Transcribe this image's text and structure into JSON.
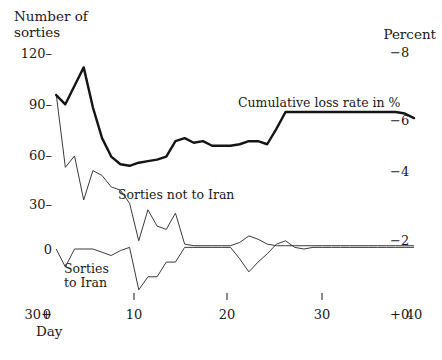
{
  "chart_data": {
    "type": "line",
    "title": "",
    "left_axis": {
      "title_line1": "Number of",
      "title_line2": "sorties",
      "label": "Number of sorties",
      "ticks": [
        "120",
        "90",
        "60",
        "30",
        "0",
        "30+"
      ],
      "tick_values": [
        120,
        90,
        60,
        30,
        0,
        -30
      ],
      "ylim": [
        -30,
        120
      ]
    },
    "right_axis": {
      "title": "Percent",
      "label": "Percent",
      "ticks": [
        "−8",
        "−6",
        "−4",
        "−2",
        "+0"
      ],
      "tick_values": [
        8,
        6,
        4,
        2,
        0
      ],
      "ylim": [
        0,
        8
      ]
    },
    "xaxis": {
      "label": "Day",
      "ticks": [
        "0",
        "10",
        "20",
        "30",
        "40"
      ],
      "tick_values": [
        0,
        10,
        20,
        30,
        40
      ],
      "xlim": [
        0,
        40
      ]
    },
    "grid": false,
    "legend_position": "inline-annotations",
    "series": [
      {
        "name": "Cumulative loss rate in %",
        "axis": "right",
        "style": "thick",
        "annotation": "Cumulative loss rate in %",
        "x": [
          1,
          2,
          3,
          4,
          5,
          6,
          7,
          8,
          9,
          10,
          11,
          12,
          13,
          14,
          15,
          16,
          17,
          18,
          19,
          20,
          21,
          22,
          23,
          24,
          25,
          26,
          27,
          28,
          29,
          30,
          31,
          32,
          33,
          34,
          35,
          36,
          37,
          38,
          39,
          40
        ],
        "y": [
          6.6,
          6.3,
          6.9,
          7.5,
          6.2,
          5.2,
          4.6,
          4.35,
          4.3,
          4.4,
          4.45,
          4.5,
          4.6,
          5.1,
          5.2,
          5.05,
          5.1,
          4.95,
          4.95,
          4.95,
          5.0,
          5.1,
          5.1,
          5.0,
          5.5,
          6.05,
          6.05,
          6.05,
          6.05,
          6.05,
          6.05,
          6.05,
          6.05,
          6.05,
          6.05,
          6.05,
          6.05,
          6.05,
          6.0,
          5.85
        ]
      },
      {
        "name": "Sorties not to Iran",
        "axis": "left",
        "style": "thin",
        "annotation": "Sorties not to Iran",
        "x": [
          1,
          2,
          3,
          4,
          5,
          6,
          7,
          8,
          9,
          10,
          11,
          12,
          13,
          14,
          15,
          16,
          17,
          18,
          19,
          20,
          21,
          22,
          23,
          24,
          25,
          26,
          27,
          28,
          29,
          30,
          31,
          32,
          33,
          34,
          35,
          36,
          37,
          38,
          39,
          40
        ],
        "y": [
          95,
          50,
          57,
          30,
          48,
          45,
          38,
          36,
          28,
          5,
          24,
          14,
          12,
          22,
          3,
          2,
          2,
          2,
          2,
          2,
          4,
          8,
          6,
          3,
          2,
          2,
          2,
          2,
          2,
          2,
          2,
          2,
          2,
          2,
          2,
          2,
          2,
          2,
          2,
          2
        ]
      },
      {
        "name": "Sorties to Iran",
        "axis": "left",
        "style": "thin",
        "annotation_line1": "Sorties",
        "annotation_line2": "to Iran",
        "annotation": "Sorties to Iran",
        "x": [
          1,
          2,
          3,
          4,
          5,
          6,
          7,
          8,
          9,
          10,
          11,
          12,
          13,
          14,
          15,
          16,
          17,
          18,
          19,
          20,
          21,
          22,
          23,
          24,
          25,
          26,
          27,
          28,
          29,
          30,
          31,
          32,
          33,
          34,
          35,
          36,
          37,
          38,
          39,
          40
        ],
        "y": [
          0,
          -11,
          0,
          0,
          0,
          -2,
          -4,
          -1,
          1,
          -25,
          -17,
          -17,
          -8,
          -8,
          1,
          1,
          1,
          1,
          1,
          1,
          -6,
          -14,
          -8,
          -3,
          3,
          5,
          1,
          0,
          1,
          1,
          1,
          1,
          1,
          1,
          1,
          1,
          1,
          1,
          1,
          1
        ]
      }
    ],
    "annotations": [
      {
        "text": "Cumulative loss rate in %",
        "x": 22,
        "y": 6.6
      },
      {
        "text": "Sorties not to Iran",
        "x": 12,
        "y": 32
      },
      {
        "text": "Sorties to Iran",
        "x": 6,
        "y": -12
      }
    ]
  },
  "axis_titles": {
    "left_line1": "Number of",
    "left_line2": "sorties",
    "right": "Percent",
    "x": "Day"
  },
  "left_ticks": [
    {
      "label": "120",
      "y": 53
    },
    {
      "label": "90",
      "y": 104
    },
    {
      "label": "60",
      "y": 155
    },
    {
      "label": "30",
      "y": 204
    },
    {
      "label": "0",
      "y": 249
    },
    {
      "label": "30+",
      "y": 300
    }
  ],
  "right_ticks": [
    {
      "label": "−8",
      "y": 52
    },
    {
      "label": "−6",
      "y": 120
    },
    {
      "label": "−4",
      "y": 171
    },
    {
      "label": "−2",
      "y": 240
    },
    {
      "label": "+0",
      "y": 298
    }
  ],
  "x_ticks": [
    {
      "label": "0",
      "x": 47
    },
    {
      "label": "10",
      "x": 134
    },
    {
      "label": "20",
      "x": 227
    },
    {
      "label": "30",
      "x": 322
    },
    {
      "label": "40",
      "x": 414
    }
  ],
  "series_labels": {
    "cumulative": "Cumulative loss rate in %",
    "not_to_iran": "Sorties not to Iran",
    "to_iran_line1": "Sorties",
    "to_iran_line2": "to Iran"
  },
  "colors": {
    "ink": "#1a1a1a",
    "background": "#ffffff",
    "thick_line": "#141414",
    "thin_line": "#3a3a3a"
  }
}
